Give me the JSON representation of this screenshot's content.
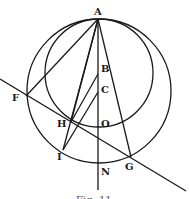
{
  "diagram": {
    "type": "geometric-figure",
    "points": [
      {
        "name": "A",
        "label": "A"
      },
      {
        "name": "B",
        "label": "B"
      },
      {
        "name": "C",
        "label": "C"
      },
      {
        "name": "O",
        "label": "O"
      },
      {
        "name": "N",
        "label": "N"
      },
      {
        "name": "F",
        "label": "F"
      },
      {
        "name": "H",
        "label": "H"
      },
      {
        "name": "I",
        "label": "I"
      },
      {
        "name": "G",
        "label": "G"
      }
    ],
    "circles": [
      "large circle through A, F, I, N, G",
      "small circle through A, H, O"
    ],
    "caption": "Fig. 11"
  },
  "colors": {
    "ink": "#1a1a1a",
    "paper": "#ffffff"
  }
}
